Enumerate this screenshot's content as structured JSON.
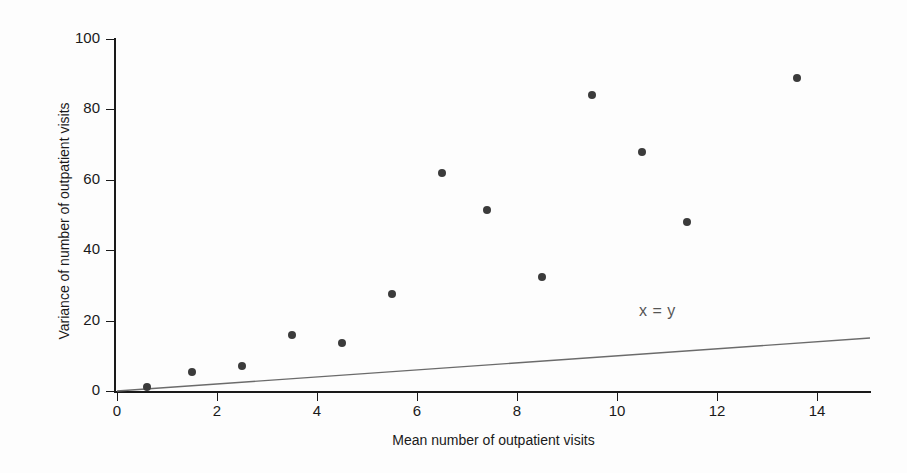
{
  "chart_data": {
    "type": "scatter",
    "title": "",
    "xlabel": "Mean number of outpatient visits",
    "ylabel": "Variance of number of outpatient visits",
    "xlim": [
      0,
      15.06
    ],
    "ylim": [
      0,
      100
    ],
    "xticks": [
      0,
      2,
      4,
      6,
      8,
      10,
      12,
      14
    ],
    "xtick_labels": [
      "0",
      "2",
      "4",
      "6",
      "8",
      "10",
      "12",
      "14"
    ],
    "yticks": [
      0,
      20,
      40,
      60,
      80,
      100
    ],
    "ytick_labels": [
      "0",
      "20",
      "40",
      "60",
      "80",
      "100"
    ],
    "grid": false,
    "legend": null,
    "marker_color": "#3b3b3b",
    "marker_size": 8,
    "points": [
      {
        "x": 0.6,
        "y": 1.0
      },
      {
        "x": 1.5,
        "y": 5.5
      },
      {
        "x": 2.5,
        "y": 7.0
      },
      {
        "x": 3.5,
        "y": 16.0
      },
      {
        "x": 4.5,
        "y": 13.5
      },
      {
        "x": 5.5,
        "y": 27.5
      },
      {
        "x": 6.5,
        "y": 62.0
      },
      {
        "x": 7.4,
        "y": 51.5
      },
      {
        "x": 8.5,
        "y": 32.5
      },
      {
        "x": 9.5,
        "y": 84.0
      },
      {
        "x": 10.5,
        "y": 68.0
      },
      {
        "x": 11.4,
        "y": 48.0
      },
      {
        "x": 13.6,
        "y": 89.0
      }
    ],
    "reference_line": {
      "label": "x = y",
      "slope": 1,
      "intercept": 0,
      "color": "#6b6b6b",
      "x_start": 0,
      "x_end": 15.06,
      "label_x": 11.4,
      "label_y": 22.5
    }
  },
  "axes": {
    "x_title": "Mean number of outpatient visits",
    "y_title": "Variance of number of outpatient visits"
  },
  "annotations": {
    "identity_line_label": "x = y"
  }
}
